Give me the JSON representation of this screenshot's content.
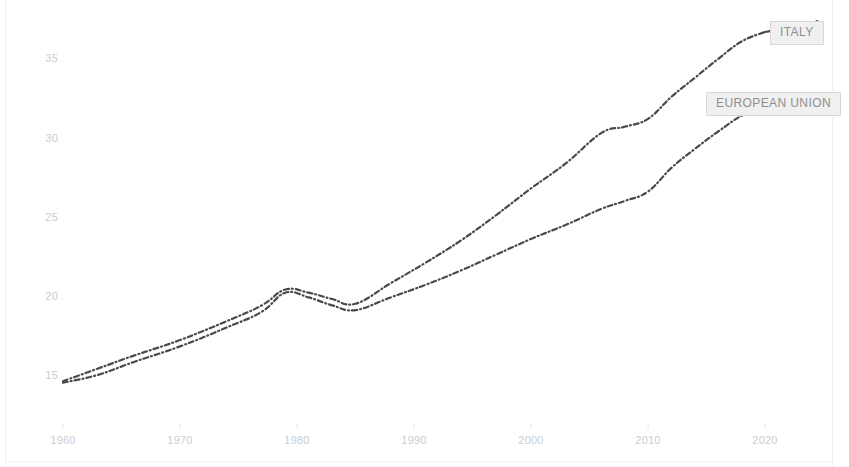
{
  "chart_data": {
    "type": "line",
    "title": "",
    "subtitle": "",
    "xlabel": "",
    "ylabel": "",
    "xlim": [
      1958,
      2024
    ],
    "ylim": [
      13.6,
      37.6
    ],
    "grid": true,
    "grid_style": "dotted-horizontal",
    "legend_position": "inline-end-of-line",
    "line_style": "dash-dot",
    "line_color": "#4a4a4a",
    "x_ticks": [
      1960,
      1970,
      1980,
      1990,
      2000,
      2010,
      2020
    ],
    "y_ticks": [
      15,
      20,
      25,
      30,
      35
    ],
    "series": [
      {
        "name": "ITALY",
        "label": "ITALY",
        "color": "#4a4a4a",
        "x": [
          1960,
          1963,
          1966,
          1970,
          1974,
          1977,
          1979,
          1981,
          1983,
          1985,
          1988,
          1991,
          1994,
          1997,
          2000,
          2003,
          2006,
          2008,
          2010,
          2012,
          2014,
          2016,
          2018,
          2020
        ],
        "values": [
          14.8,
          15.6,
          16.4,
          17.4,
          18.6,
          19.6,
          20.6,
          20.4,
          20.0,
          19.7,
          21.0,
          22.3,
          23.7,
          25.3,
          27.0,
          28.6,
          30.5,
          30.9,
          31.4,
          32.8,
          34.0,
          35.2,
          36.3,
          36.9
        ]
      },
      {
        "name": "EUROPEAN UNION",
        "label": "EUROPEAN UNION",
        "color": "#4a4a4a",
        "x": [
          1960,
          1963,
          1966,
          1970,
          1974,
          1977,
          1979,
          1981,
          1983,
          1985,
          1988,
          1991,
          1994,
          1997,
          2000,
          2003,
          2006,
          2008,
          2010,
          2012,
          2014,
          2016,
          2018,
          2020
        ],
        "values": [
          14.7,
          15.2,
          16.0,
          17.0,
          18.2,
          19.2,
          20.4,
          20.1,
          19.6,
          19.3,
          20.1,
          20.9,
          21.8,
          22.8,
          23.8,
          24.7,
          25.7,
          26.2,
          26.8,
          28.3,
          29.5,
          30.6,
          31.6,
          32.2
        ]
      }
    ]
  },
  "axis": {
    "y_tick_labels": [
      "35",
      "30",
      "25",
      "20",
      "15"
    ],
    "x_tick_labels": [
      "1960",
      "1970",
      "1980",
      "1990",
      "2000",
      "2010",
      "2020"
    ]
  },
  "labels": {
    "italy": "ITALY",
    "european_union": "EUROPEAN UNION"
  }
}
